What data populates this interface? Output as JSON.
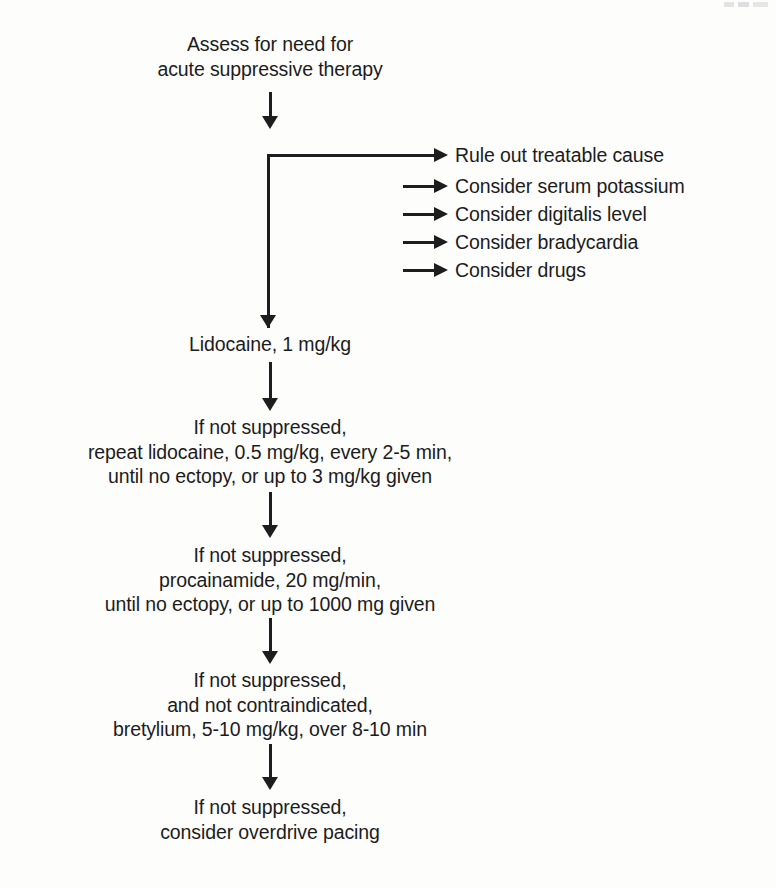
{
  "diagram": {
    "type": "flowchart",
    "orientation": "top-to-bottom",
    "background_color": "#fdfdfc",
    "ink_color": "#1d1d1d",
    "nodes": [
      {
        "id": "assess",
        "lines": [
          "Assess for need for",
          "acute suppressive therapy"
        ]
      },
      {
        "id": "lidocaine-initial",
        "lines": [
          "Lidocaine, 1 mg/kg"
        ]
      },
      {
        "id": "lidocaine-repeat",
        "lines": [
          "If not suppressed,",
          "repeat lidocaine, 0.5 mg/kg, every 2-5 min,",
          "until no ectopy, or up to 3 mg/kg given"
        ]
      },
      {
        "id": "procainamide",
        "lines": [
          "If not suppressed,",
          "procainamide, 20 mg/min,",
          "until no ectopy, or up to 1000 mg given"
        ]
      },
      {
        "id": "bretylium",
        "lines": [
          "If not suppressed,",
          "and not contraindicated,",
          "bretylium, 5-10 mg/kg, over 8-10 min"
        ]
      },
      {
        "id": "overdrive-pacing",
        "lines": [
          "If not suppressed,",
          "consider overdrive pacing"
        ]
      }
    ],
    "branches": {
      "label": "Rule out treatable cause checklist",
      "items": [
        "Rule out treatable cause",
        "Consider serum potassium",
        "Consider digitalis level",
        "Consider bradycardia",
        "Consider drugs"
      ]
    }
  }
}
